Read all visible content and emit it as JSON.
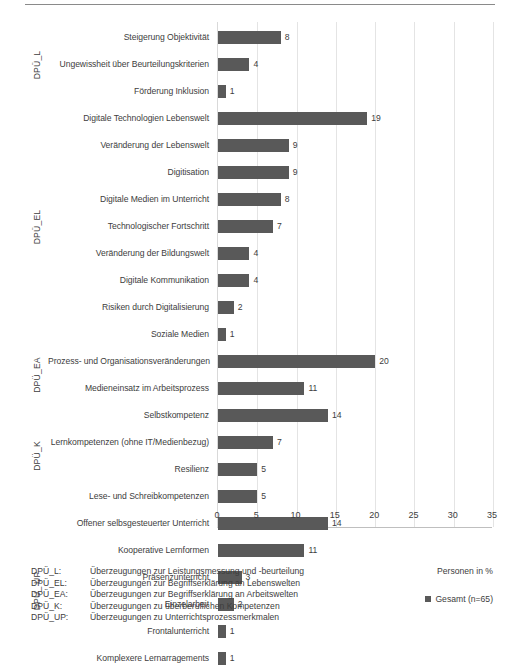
{
  "chart_data": {
    "type": "bar",
    "orientation": "horizontal",
    "title": "",
    "xlabel": "Personen in %",
    "ylabel": "",
    "xlim": [
      0,
      35
    ],
    "xticks": [
      0,
      5,
      10,
      15,
      20,
      25,
      30,
      35
    ],
    "grid": "vertical",
    "legend": [
      {
        "label": "Gesamt (n=65)",
        "color": "#595959"
      }
    ],
    "legend_position": "bottom-right",
    "categories": [
      "Steigerung Objektivität",
      "Ungewissheit über Beurteilungskriterien",
      "Förderung Inklusion",
      "Digitale Technologien Lebenswelt",
      "Veränderung der Lebenswelt",
      "Digitisation",
      "Digitale Medien im Unterricht",
      "Technologischer Fortschritt",
      "Veränderung der Bildungswelt",
      "Digitale Kommunikation",
      "Risiken durch Digitalisierung",
      "Soziale Medien",
      "Prozess- und Organisationsveränderungen",
      "Medieneinsatz im Arbeitsprozess",
      "Selbstkompetenz",
      "Lernkompetenzen (ohne IT/Medienbezug)",
      "Resilienz",
      "Lese- und Schreibkompetenzen",
      "Offener selbsgesteuerter Unterricht",
      "Kooperative Lernformen",
      "Präsenzunterricht",
      "Einzelarbeit",
      "Frontalunterricht",
      "Komplexere Lernarragements"
    ],
    "values": [
      8,
      4,
      1,
      19,
      9,
      9,
      8,
      7,
      4,
      4,
      2,
      1,
      20,
      11,
      14,
      7,
      5,
      5,
      14,
      11,
      3,
      2,
      1,
      1
    ],
    "series": [
      {
        "name": "Gesamt (n=65)",
        "color": "#595959",
        "values": [
          8,
          4,
          1,
          19,
          9,
          9,
          8,
          7,
          4,
          4,
          2,
          1,
          20,
          11,
          14,
          7,
          5,
          5,
          14,
          11,
          3,
          2,
          1,
          1
        ]
      }
    ],
    "groups": [
      {
        "label": "DPÜ_L",
        "start": 0,
        "count": 3
      },
      {
        "label": "DPÜ_EL",
        "start": 3,
        "count": 9
      },
      {
        "label": "DPÜ_EA",
        "start": 12,
        "count": 2
      },
      {
        "label": "DPÜ_K",
        "start": 14,
        "count": 4
      },
      {
        "label": "DPÜ_ UP",
        "start": 18,
        "count": 6
      }
    ]
  },
  "footnotes": [
    {
      "key": "DPÜ_L:",
      "desc": "Überzeugungen zur Leistungsmessung und -beurteilung"
    },
    {
      "key": "DPÜ_EL:",
      "desc": "Überzeugungen zur Begriffserklärung an Lebenswelten"
    },
    {
      "key": "DPÜ_EA:",
      "desc": "Überzeugungen zur Begriffserklärung an Arbeitswelten"
    },
    {
      "key": "DPÜ_K:",
      "desc": "Überzeugungen zu überberuflichen Kompetenzen"
    },
    {
      "key": "DPÜ_UP:",
      "desc": "Überzeugungen zu Unterrichtsprozessmerkmalen"
    }
  ],
  "colors": {
    "bar": "#595959",
    "text": "#3d3d3d",
    "gridline": "#e4e4e4",
    "axis": "#bfbfbf",
    "rule": "#8a8a8a"
  }
}
